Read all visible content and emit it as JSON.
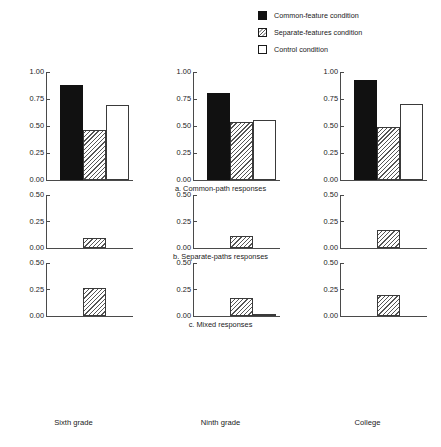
{
  "legend": {
    "position": "top-right",
    "items": [
      {
        "label": "Common-feature condition",
        "swatch": "solid-black-square-icon",
        "style": "solid"
      },
      {
        "label": "Separate-features condition",
        "swatch": "hatched-square-icon",
        "style": "hatch"
      },
      {
        "label": "Control condition",
        "swatch": "open-square-icon",
        "style": "open"
      }
    ]
  },
  "chart_data": {
    "type": "bar",
    "title": "",
    "xlabel": "",
    "ylabel": "",
    "grid": false,
    "legend_position": "top-right",
    "categories": [
      "Sixth grade",
      "Ninth grade",
      "College"
    ],
    "series": [
      {
        "name": "Common-feature condition",
        "style": "solid"
      },
      {
        "name": "Separate-features condition",
        "style": "hatch"
      },
      {
        "name": "Control condition",
        "style": "open"
      }
    ],
    "panels": [
      {
        "id": "a",
        "caption": "a. Common-path responses",
        "ylim": [
          0,
          1.0
        ],
        "yticks": [
          "0.00",
          "0.25",
          "0.50",
          "0.75",
          "1.00"
        ],
        "ytick_values": [
          0.0,
          0.25,
          0.5,
          0.75,
          1.0
        ],
        "groups": [
          {
            "category": "Sixth grade",
            "values": [
              0.88,
              0.46,
              0.69
            ]
          },
          {
            "category": "Ninth grade",
            "values": [
              0.81,
              0.54,
              0.56
            ]
          },
          {
            "category": "College",
            "values": [
              0.93,
              0.49,
              0.7
            ]
          }
        ]
      },
      {
        "id": "b",
        "caption": "b. Separate-paths responses",
        "ylim": [
          0,
          0.5
        ],
        "yticks": [
          "0.00",
          "0.25",
          "0.50"
        ],
        "ytick_values": [
          0.0,
          0.25,
          0.5
        ],
        "groups": [
          {
            "category": "Sixth grade",
            "values": [
              0.0,
              0.09,
              0.0
            ]
          },
          {
            "category": "Ninth grade",
            "values": [
              0.0,
              0.11,
              0.0
            ]
          },
          {
            "category": "College",
            "values": [
              0.0,
              0.17,
              0.0
            ]
          }
        ]
      },
      {
        "id": "c",
        "caption": "c. Mixed responses",
        "ylim": [
          0,
          0.5
        ],
        "yticks": [
          "0.00",
          "0.25",
          "0.50"
        ],
        "ytick_values": [
          0.0,
          0.25,
          0.5
        ],
        "groups": [
          {
            "category": "Sixth grade",
            "values": [
              0.0,
              0.26,
              0.0
            ]
          },
          {
            "category": "Ninth grade",
            "values": [
              0.0,
              0.17,
              0.02
            ]
          },
          {
            "category": "College",
            "values": [
              0.0,
              0.2,
              0.0
            ]
          }
        ]
      }
    ]
  },
  "colors": {
    "solid_bar": "#111111",
    "hatch_line": "#555555",
    "bar_outline": "#3a3a3a",
    "axis": "#4a4a4a",
    "text": "#1a1a1a",
    "background": "#ffffff"
  }
}
